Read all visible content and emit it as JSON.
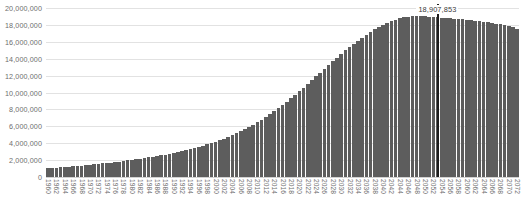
{
  "chart_data": {
    "type": "bar",
    "title": "",
    "subtitle": "",
    "xlabel": "",
    "ylabel": "",
    "ylim": [
      0,
      20000000
    ],
    "ytick_step": 2000000,
    "ytick_labels": [
      "20,000,000",
      "18,000,000",
      "16,000,000",
      "14,000,000",
      "12,000,000",
      "10,000,000",
      "8,000,000",
      "6,000,000",
      "4,000,000",
      "2,000,000",
      "0"
    ],
    "ytick_values": [
      20000000,
      18000000,
      16000000,
      14000000,
      12000000,
      10000000,
      8000000,
      6000000,
      4000000,
      2000000,
      0
    ],
    "grid": true,
    "legend": null,
    "legend_position": "none",
    "bar_color": "#5d5d5d",
    "grid_color": "#e2e2e2",
    "tick_label_color": "#6e6e6e",
    "xtick_interval_years": 2,
    "xtick_rotation_degrees": 90,
    "annotation": {
      "text": "18,907,853",
      "value": 18907853,
      "category": "2053",
      "marker": "vertical-line",
      "marker_color": "#1d1d1d"
    },
    "categories": [
      "1960",
      "1961",
      "1962",
      "1963",
      "1964",
      "1965",
      "1966",
      "1967",
      "1968",
      "1969",
      "1970",
      "1971",
      "1972",
      "1973",
      "1974",
      "1975",
      "1976",
      "1977",
      "1978",
      "1979",
      "1980",
      "1981",
      "1982",
      "1983",
      "1984",
      "1985",
      "1986",
      "1987",
      "1988",
      "1989",
      "1990",
      "1991",
      "1992",
      "1993",
      "1994",
      "1995",
      "1996",
      "1997",
      "1998",
      "1999",
      "2000",
      "2001",
      "2002",
      "2003",
      "2004",
      "2005",
      "2006",
      "2007",
      "2008",
      "2009",
      "2010",
      "2011",
      "2012",
      "2013",
      "2014",
      "2015",
      "2016",
      "2017",
      "2018",
      "2019",
      "2020",
      "2021",
      "2022",
      "2023",
      "2024",
      "2025",
      "2026",
      "2027",
      "2028",
      "2029",
      "2030",
      "2031",
      "2032",
      "2033",
      "2034",
      "2035",
      "2036",
      "2037",
      "2038",
      "2039",
      "2040",
      "2041",
      "2042",
      "2043",
      "2044",
      "2045",
      "2046",
      "2047",
      "2048",
      "2049",
      "2050",
      "2051",
      "2052",
      "2053",
      "2054",
      "2055",
      "2056",
      "2057",
      "2058",
      "2059",
      "2060",
      "2061",
      "2062",
      "2063",
      "2064",
      "2065",
      "2066",
      "2067",
      "2068",
      "2069",
      "2070",
      "2071",
      "2072"
    ],
    "xtick_labels_shown": [
      "1960",
      "1962",
      "1964",
      "1966",
      "1968",
      "1970",
      "1972",
      "1974",
      "1976",
      "1978",
      "1980",
      "1982",
      "1984",
      "1986",
      "1988",
      "1990",
      "1992",
      "1994",
      "1996",
      "1998",
      "2000",
      "2002",
      "2004",
      "2006",
      "2008",
      "2010",
      "2012",
      "2014",
      "2016",
      "2018",
      "2020",
      "2022",
      "2024",
      "2026",
      "2028",
      "2030",
      "2032",
      "2034",
      "2036",
      "2038",
      "2040",
      "2042",
      "2044",
      "2046",
      "2048",
      "2050",
      "2052",
      "2054",
      "2056",
      "2058",
      "2060",
      "2062",
      "2064",
      "2066",
      "2068",
      "2070",
      "2072"
    ],
    "values": [
      1050000,
      1080000,
      1115000,
      1150000,
      1190000,
      1230000,
      1270000,
      1310000,
      1355000,
      1400000,
      1450000,
      1500000,
      1550000,
      1600000,
      1655000,
      1710000,
      1770000,
      1830000,
      1890000,
      1955000,
      2020000,
      2090000,
      2160000,
      2235000,
      2310000,
      2390000,
      2470000,
      2560000,
      2650000,
      2745000,
      2845000,
      2950000,
      3060000,
      3175000,
      3295000,
      3420000,
      3555000,
      3700000,
      3850000,
      4010000,
      4180000,
      4360000,
      4550000,
      4750000,
      4960000,
      5180000,
      5420000,
      5670000,
      5930000,
      6210000,
      6500000,
      6800000,
      7115000,
      7445000,
      7790000,
      8150000,
      8520000,
      8910000,
      9310000,
      9720000,
      10140000,
      10570000,
      11010000,
      11450000,
      11900000,
      12350000,
      12800000,
      13250000,
      13690000,
      14130000,
      14560000,
      14980000,
      15390000,
      15780000,
      16150000,
      16510000,
      16850000,
      17170000,
      17470000,
      17750000,
      18010000,
      18250000,
      18460000,
      18640000,
      18790000,
      18890000,
      18960000,
      19000000,
      19020000,
      19020000,
      19000000,
      18970000,
      18940000,
      18907853,
      18870000,
      18830000,
      18790000,
      18750000,
      18710000,
      18670000,
      18620000,
      18570000,
      18520000,
      18460000,
      18400000,
      18330000,
      18250000,
      18160000,
      18060000,
      17950000,
      17830000,
      17700000,
      17560000
    ]
  }
}
